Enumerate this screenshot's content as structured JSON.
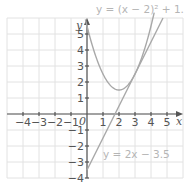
{
  "chart_data": {
    "type": "line",
    "title": "",
    "xlabel": "x",
    "ylabel": "y",
    "origin_label": "0",
    "xlim": [
      -5,
      6
    ],
    "ylim": [
      -4,
      6
    ],
    "grid": true,
    "x_ticks": [
      -4,
      -3,
      -2,
      -1,
      1,
      2,
      3,
      4,
      5
    ],
    "x_tick_labels": [
      "−4",
      "−3",
      "−2",
      "−1",
      "1",
      "2",
      "3",
      "4",
      "5"
    ],
    "y_ticks": [
      5,
      4,
      3,
      2,
      1,
      -1,
      -2,
      -3,
      -4
    ],
    "y_tick_labels": [
      "5",
      "4",
      "3",
      "2",
      "1",
      "−1",
      "−2",
      "−3",
      "−4"
    ],
    "series": [
      {
        "name": "y = (x − 2)² + 1.5",
        "kind": "parabola",
        "equation": "y = (x - 2)^2 + 1.5",
        "x": [
          -0.1,
          0,
          0.5,
          1,
          1.5,
          2,
          2.5,
          3,
          3.5,
          4,
          4.2
        ],
        "y": [
          5.91,
          5.5,
          3.75,
          2.5,
          1.75,
          1.5,
          1.75,
          2.5,
          3.75,
          5.5,
          6.34
        ]
      },
      {
        "name": "y = 2x − 3.5",
        "kind": "line",
        "equation": "y = 2x - 3.5",
        "x": [
          0,
          4.75
        ],
        "y": [
          -3.5,
          6
        ]
      }
    ],
    "annotations": [
      {
        "text": "y = (x − 2)² + 1.5",
        "near": "top"
      },
      {
        "text": "y = 2x − 3.5",
        "near": "bottom-right of line"
      }
    ]
  },
  "labels": {
    "parabola": "y = (x − 2)² + 1.5",
    "line": "y = 2x − 3.5",
    "x_axis": "x",
    "y_axis": "y",
    "origin": "0"
  }
}
